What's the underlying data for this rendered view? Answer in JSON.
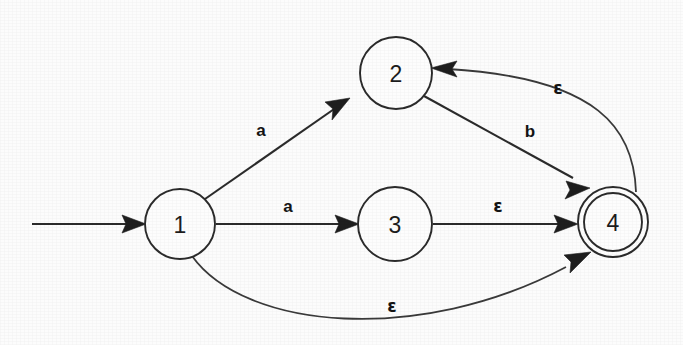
{
  "diagram": {
    "background_color": "#fcfcfc",
    "ink_color": "#2b2b2b",
    "width": 683,
    "height": 345,
    "states": [
      {
        "id": "1",
        "label": "1",
        "cx": 180,
        "cy": 224,
        "r": 35,
        "accepting": false,
        "start": true
      },
      {
        "id": "2",
        "label": "2",
        "cx": 396,
        "cy": 73,
        "r": 36,
        "accepting": false,
        "start": false
      },
      {
        "id": "3",
        "label": "3",
        "cx": 395,
        "cy": 224,
        "r": 37,
        "accepting": false,
        "start": false
      },
      {
        "id": "4",
        "label": "4",
        "cx": 613,
        "cy": 222,
        "r": 35,
        "accepting": true,
        "start": false
      }
    ],
    "start_arrow": {
      "name": "start-arrow",
      "from_x": 32,
      "to_x": 145,
      "y": 224
    },
    "transitions": [
      {
        "id": "t1",
        "from": "1",
        "to": "2",
        "label": "a",
        "label_x": 261,
        "label_y": 130,
        "kind": "straight"
      },
      {
        "id": "t2",
        "from": "1",
        "to": "3",
        "label": "a",
        "label_x": 288,
        "label_y": 207,
        "kind": "straight"
      },
      {
        "id": "t3",
        "from": "3",
        "to": "4",
        "label": "ε",
        "label_x": 498,
        "label_y": 207,
        "kind": "straight"
      },
      {
        "id": "t4",
        "from": "2",
        "to": "4",
        "label": "b",
        "label_x": 530,
        "label_y": 131,
        "kind": "straight"
      },
      {
        "id": "t5",
        "from": "4",
        "to": "2",
        "label": "ε",
        "label_x": 558,
        "label_y": 88,
        "kind": "curve-upper"
      },
      {
        "id": "t6",
        "from": "1",
        "to": "4",
        "label": "ε",
        "label_x": 392,
        "label_y": 306,
        "kind": "curve-lower"
      }
    ],
    "alphabet": [
      "a",
      "b",
      "ε"
    ],
    "start_state": "1",
    "accepting_states": [
      "4"
    ]
  }
}
